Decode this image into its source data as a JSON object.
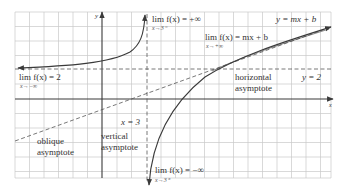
{
  "diagram": {
    "colors": {
      "background": "#ffffff",
      "grid": "#c8c8c8",
      "axis": "#3a3a3a",
      "curve": "#3a3a3a",
      "asymptote": "#555555",
      "text": "#333333"
    },
    "axes": {
      "x_label": "x",
      "y_label": "y"
    },
    "asymptotes": {
      "vertical": {
        "equation": "x = 3",
        "name_line1": "vertical",
        "name_line2": "asymptote"
      },
      "horizontal": {
        "equation": "y = 2",
        "name_line1": "horizontal",
        "name_line2": "asymptote"
      },
      "oblique": {
        "equation": "y = mx + b",
        "name_line1": "oblique",
        "name_line2": "asymptote"
      }
    },
    "limits": {
      "left_infinity": {
        "expr": "lim f(x) = 2",
        "sub": "x→−∞"
      },
      "right_of_3_from_left": {
        "expr": "lim f(x) = +∞",
        "sub": "x→3⁻"
      },
      "right_of_3_from_right": {
        "expr": "lim f(x) = −∞",
        "sub": "x→3⁺"
      },
      "plus_infinity": {
        "expr": "lim f(x) = mx + b",
        "sub": "x→+∞"
      }
    }
  }
}
